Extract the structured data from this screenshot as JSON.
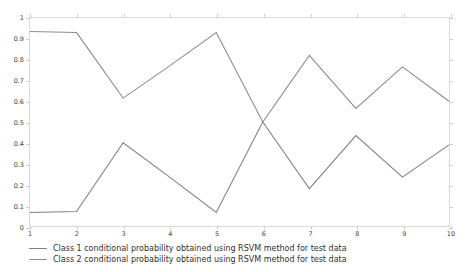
{
  "chart_data": {
    "type": "line",
    "title": "",
    "subtitle": "",
    "xlabel": "",
    "ylabel": "",
    "x": [
      1,
      2,
      3,
      4,
      5,
      6,
      7,
      8,
      9,
      10
    ],
    "xticklabels": [
      "1",
      "2",
      "3",
      "4",
      "5",
      "6",
      "7",
      "8",
      "9",
      "10"
    ],
    "yticklabels": [
      "0",
      "0.1",
      "0.2",
      "0.3",
      "0.4",
      "0.5",
      "0.6",
      "0.7",
      "0.8",
      "0.9",
      "1"
    ],
    "ytickvalues": [
      0,
      0.1,
      0.2,
      0.3,
      0.4,
      0.5,
      0.6,
      0.7,
      0.8,
      0.9,
      1
    ],
    "xlim": [
      1,
      10
    ],
    "ylim": [
      0,
      1
    ],
    "grid": false,
    "legend_position": "below-axes-left",
    "series": [
      {
        "name": "Class 1 conditional probability obtained using  RSVM method for test data",
        "color": "#808080",
        "values": [
          0.065,
          0.07,
          0.4,
          0.235,
          0.065,
          0.5,
          0.18,
          0.435,
          0.235,
          0.39
        ]
      },
      {
        "name": "Class 2 conditional probability obtained using  RSVM method for test data",
        "color": "#8c8c8c",
        "values": [
          0.935,
          0.93,
          0.615,
          0.77,
          0.93,
          0.5,
          0.82,
          0.565,
          0.765,
          0.6
        ]
      }
    ]
  },
  "legend": {
    "items": [
      {
        "label": "Class 1 conditional probability obtained using  RSVM method for test data",
        "color": "#808080"
      },
      {
        "label": "Class 2 conditional probability obtained using  RSVM method for test data",
        "color": "#8c8c8c"
      }
    ]
  },
  "axes": {
    "frame_color": "#d9d9d9",
    "tick_color": "#cfcfcf",
    "label_color": "#454545"
  },
  "figure": {
    "background": "#ffffff"
  }
}
